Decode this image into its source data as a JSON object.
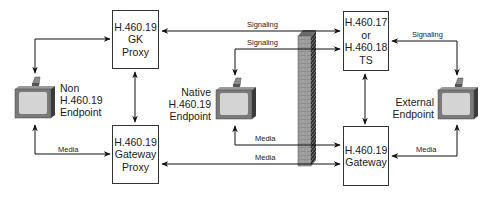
{
  "diagram": {
    "nodes": {
      "gk_proxy": {
        "lines": [
          "H.460.19",
          "GK",
          "Proxy"
        ]
      },
      "gateway_proxy": {
        "lines": [
          "H.460.19",
          "Gateway",
          "Proxy"
        ]
      },
      "ts": {
        "lines": [
          "H.460.17",
          "or",
          "H.460.18",
          "TS"
        ]
      },
      "gateway": {
        "lines": [
          "H.460.19",
          "Gateway"
        ]
      }
    },
    "endpoints": {
      "non": {
        "lines": [
          "Non",
          "H.460.19",
          "Endpoint"
        ]
      },
      "native": {
        "lines": [
          "Native",
          "H.460.19",
          "Endpoint"
        ]
      },
      "external": {
        "lines": [
          "External",
          "Endpoint"
        ]
      }
    },
    "edge_labels": {
      "signaling_top": "Signaling",
      "signaling_second": "Signaling",
      "signaling_external": "Signaling",
      "media_non": "Media",
      "media_native": "Media",
      "media_proxy": "Media",
      "media_external": "Media"
    },
    "colors": {
      "line": "#111111",
      "box_border": "#333333",
      "brick": "#8a8a8a",
      "brick_dark": "#4a4a4a",
      "monitor_body": "#7a7a7a",
      "monitor_screen": "#d4d4d4"
    }
  }
}
